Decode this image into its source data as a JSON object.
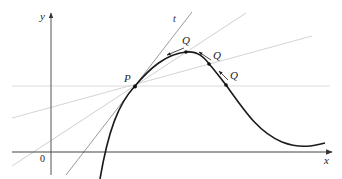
{
  "figure": {
    "axes": {
      "x_label": "x",
      "y_label": "y",
      "origin_label": "0",
      "axis_color": "#555555"
    },
    "curve": {
      "color": "#1a1a1a"
    },
    "tangent": {
      "label": "t",
      "color": "#9a9a9a"
    },
    "secants": {
      "color": "#d4d4d4"
    },
    "points": {
      "P": {
        "label": "P"
      },
      "Q": [
        {
          "label": "Q"
        },
        {
          "label": "Q"
        },
        {
          "label": "Q"
        }
      ]
    },
    "arrow_color": "#333333"
  }
}
